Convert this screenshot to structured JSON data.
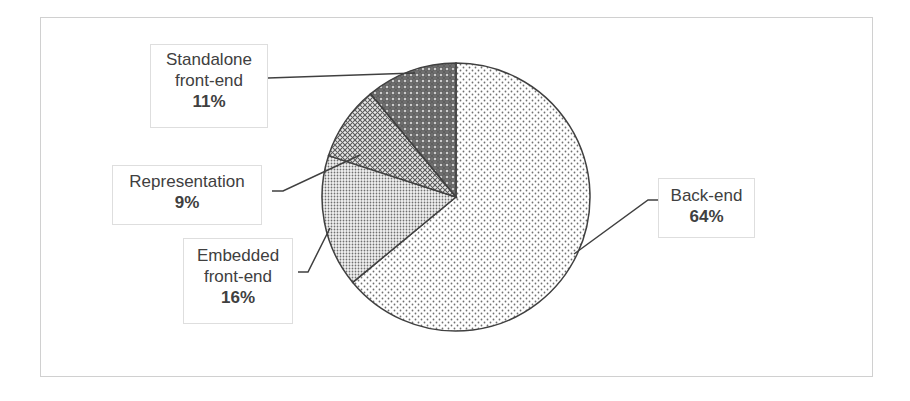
{
  "chart_data": {
    "type": "pie",
    "title": "",
    "categories": [
      "Back-end",
      "Embedded front-end",
      "Representation",
      "Standalone front-end"
    ],
    "values": [
      64,
      16,
      9,
      11
    ],
    "unit": "%",
    "start_angle": "12 o'clock, clockwise",
    "legend": "none (data labels with leader lines)",
    "labels": [
      {
        "name_lines": [
          "Back-end"
        ],
        "pct": "64%"
      },
      {
        "name_lines": [
          "Embedded",
          "front-end"
        ],
        "pct": "16%"
      },
      {
        "name_lines": [
          "Representation"
        ],
        "pct": "9%"
      },
      {
        "name_lines": [
          "Standalone",
          "front-end"
        ],
        "pct": "11%"
      }
    ],
    "fills": [
      {
        "slice": "Back-end",
        "pattern": "sparse dots on white"
      },
      {
        "slice": "Embedded front-end",
        "pattern": "dense dots"
      },
      {
        "slice": "Representation",
        "pattern": "diagonal crosshatch"
      },
      {
        "slice": "Standalone front-end",
        "pattern": "dark with white dots"
      }
    ]
  }
}
